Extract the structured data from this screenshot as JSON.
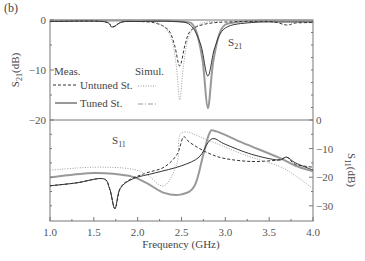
{
  "chart_data": {
    "type": "line",
    "panel_label": "(b)",
    "xlabel": "Frequency (GHz)",
    "xlim": [
      1.0,
      4.0
    ],
    "x_ticks": [
      "1.0",
      "1.5",
      "2.0",
      "2.5",
      "3.0",
      "3.5",
      "4.0"
    ],
    "top_panel": {
      "ylabel": "S21(dB)",
      "ylabel_main": "S",
      "ylabel_sub": "21",
      "ylabel_unit": "(dB)",
      "ylim": [
        -20,
        0
      ],
      "y_ticks": [
        "0",
        "−10",
        "−20"
      ],
      "annotation": {
        "main": "S",
        "sub": "21"
      },
      "series": [
        {
          "name": "Untuned St. (Meas.)",
          "style": "dashed",
          "color": "#333333",
          "x": [
            1.0,
            1.6,
            1.71,
            1.82,
            2.0,
            2.2,
            2.35,
            2.42,
            2.48,
            2.54,
            2.6,
            2.75,
            3.0,
            3.5,
            3.7,
            3.8,
            4.0
          ],
          "y": [
            -0.3,
            -0.3,
            -1.4,
            -0.4,
            -0.3,
            -0.6,
            -2.0,
            -5.0,
            -9.2,
            -5.0,
            -2.2,
            -0.9,
            -0.4,
            -0.3,
            -1.0,
            -0.6,
            -0.5
          ]
        },
        {
          "name": "Untuned St. (Simul.)",
          "style": "dotted",
          "color": "#999999",
          "x": [
            1.0,
            2.0,
            2.25,
            2.38,
            2.44,
            2.48,
            2.52,
            2.58,
            2.7,
            3.0,
            4.0
          ],
          "y": [
            -0.2,
            -0.2,
            -0.8,
            -3.5,
            -9.0,
            -16.0,
            -9.5,
            -3.5,
            -0.9,
            -0.2,
            -0.1
          ]
        },
        {
          "name": "Tuned St. (Meas.)",
          "style": "solid",
          "color": "#333333",
          "x": [
            1.0,
            1.6,
            1.71,
            1.82,
            2.0,
            2.4,
            2.6,
            2.72,
            2.8,
            2.88,
            3.0,
            3.3,
            3.7,
            4.0
          ],
          "y": [
            -0.3,
            -0.3,
            -1.4,
            -0.4,
            -0.3,
            -0.3,
            -1.0,
            -5.0,
            -11.2,
            -5.5,
            -1.6,
            -0.5,
            -0.4,
            -0.4
          ]
        },
        {
          "name": "Tuned St. (Simul.)",
          "style": "solid-gray",
          "color": "#999999",
          "x": [
            1.0,
            2.0,
            2.5,
            2.65,
            2.74,
            2.8,
            2.86,
            2.95,
            3.1,
            3.5,
            4.0
          ],
          "y": [
            -0.1,
            -0.1,
            -0.3,
            -1.5,
            -8.0,
            -17.6,
            -8.5,
            -2.0,
            -0.5,
            -0.1,
            -0.1
          ]
        }
      ]
    },
    "bottom_panel": {
      "ylabel": "S11(dB)",
      "ylabel_main": "S",
      "ylabel_sub": "11",
      "ylabel_unit": "(dB)",
      "ylim": [
        -35,
        0
      ],
      "y_ticks": [
        "0",
        "−10",
        "−20",
        "−30"
      ],
      "annotation": {
        "main": "S",
        "sub": "11"
      },
      "series": [
        {
          "name": "Untuned St. (Meas.)",
          "style": "dashed",
          "color": "#333333",
          "x": [
            1.0,
            1.3,
            1.6,
            1.68,
            1.74,
            1.8,
            1.9,
            2.1,
            2.3,
            2.45,
            2.52,
            2.6,
            2.8,
            3.0,
            3.3,
            3.6,
            3.7,
            3.8,
            4.0
          ],
          "y": [
            -23.0,
            -22.0,
            -20.5,
            -24.0,
            -31.0,
            -24.0,
            -21.0,
            -18.5,
            -16.5,
            -12.0,
            -6.0,
            -8.0,
            -11.5,
            -13.5,
            -14.5,
            -14.0,
            -13.0,
            -15.5,
            -16.5
          ]
        },
        {
          "name": "Untuned St. (Simul.)",
          "style": "dotted",
          "color": "#999999",
          "x": [
            1.0,
            1.5,
            1.9,
            2.1,
            2.3,
            2.45,
            2.5,
            2.8,
            3.2,
            3.6,
            3.8,
            4.0
          ],
          "y": [
            -17.5,
            -16.5,
            -17.0,
            -19.0,
            -23.0,
            -15.0,
            -4.5,
            -7.0,
            -12.0,
            -16.0,
            -19.5,
            -24.0
          ]
        },
        {
          "name": "Tuned St. (Meas.)",
          "style": "solid",
          "color": "#333333",
          "x": [
            1.0,
            1.3,
            1.6,
            1.68,
            1.74,
            1.8,
            1.95,
            2.2,
            2.5,
            2.7,
            2.8,
            2.87,
            3.0,
            3.3,
            3.6,
            3.7,
            3.8,
            4.0
          ],
          "y": [
            -23.0,
            -22.0,
            -20.5,
            -24.0,
            -31.0,
            -24.0,
            -20.5,
            -18.5,
            -16.0,
            -13.0,
            -8.0,
            -6.5,
            -8.5,
            -12.0,
            -14.0,
            -13.0,
            -15.0,
            -17.5
          ]
        },
        {
          "name": "Tuned St. (Simul.)",
          "style": "solid-gray",
          "color": "#999999",
          "x": [
            1.0,
            1.5,
            1.9,
            2.1,
            2.3,
            2.5,
            2.65,
            2.75,
            2.82,
            2.9,
            3.2,
            3.6,
            3.8,
            4.0
          ],
          "y": [
            -20.0,
            -18.5,
            -19.5,
            -22.0,
            -25.5,
            -26.0,
            -23.0,
            -12.0,
            -4.5,
            -4.0,
            -8.0,
            -13.0,
            -16.0,
            -18.0
          ]
        }
      ]
    },
    "legend": {
      "header_meas": "Meas.",
      "header_simul": "Simul.",
      "rows": [
        {
          "label": "Untuned St.",
          "meas_style": "dashed",
          "simul_style": "dotted"
        },
        {
          "label": "Tuned St.",
          "meas_style": "solid",
          "simul_style": "dash-dot"
        }
      ]
    },
    "grid": false
  }
}
